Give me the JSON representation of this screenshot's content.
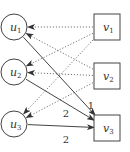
{
  "diagram": {
    "type": "bipartite-flow-graph",
    "left_nodes": [
      {
        "id": "u1",
        "base": "u",
        "sub": "1",
        "shape": "circle"
      },
      {
        "id": "u2",
        "base": "u",
        "sub": "2",
        "shape": "circle"
      },
      {
        "id": "u3",
        "base": "u",
        "sub": "3",
        "shape": "circle"
      }
    ],
    "right_nodes": [
      {
        "id": "v1",
        "base": "v",
        "sub": "1",
        "shape": "square"
      },
      {
        "id": "v2",
        "base": "v",
        "sub": "2",
        "shape": "square"
      },
      {
        "id": "v3",
        "base": "v",
        "sub": "3",
        "shape": "square"
      }
    ],
    "edges": [
      {
        "from": "v1",
        "to": "u1",
        "style": "dotted",
        "label": ""
      },
      {
        "from": "v1",
        "to": "u2",
        "style": "dotted",
        "label": ""
      },
      {
        "from": "v1",
        "to": "u3",
        "style": "dotted",
        "label": ""
      },
      {
        "from": "v2",
        "to": "u1",
        "style": "dotted",
        "label": ""
      },
      {
        "from": "v2",
        "to": "u2",
        "style": "dotted",
        "label": ""
      },
      {
        "from": "v2",
        "to": "u3",
        "style": "dotted",
        "label": ""
      },
      {
        "from": "u1",
        "to": "v3",
        "style": "solid",
        "label": "1"
      },
      {
        "from": "u2",
        "to": "v3",
        "style": "solid",
        "label": "2"
      },
      {
        "from": "u3",
        "to": "v3",
        "style": "solid",
        "label": "2"
      }
    ],
    "colors": {
      "stroke": "#444444",
      "dotted": "#777777",
      "text": "#333333"
    }
  }
}
